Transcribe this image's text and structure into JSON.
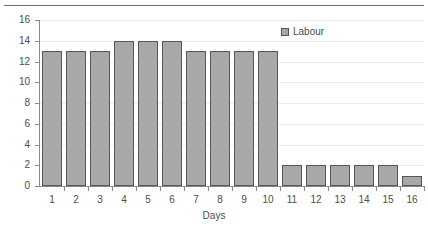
{
  "chart_data": {
    "type": "bar",
    "title": "",
    "xlabel": "Days",
    "ylabel": "",
    "categories": [
      "1",
      "2",
      "3",
      "4",
      "5",
      "6",
      "7",
      "8",
      "9",
      "10",
      "11",
      "12",
      "13",
      "14",
      "15",
      "16"
    ],
    "values": [
      13,
      13,
      13,
      14,
      14,
      14,
      13,
      13,
      13,
      13,
      2,
      2,
      2,
      2,
      2,
      1
    ],
    "series": [
      {
        "name": "Labour",
        "values": [
          13,
          13,
          13,
          14,
          14,
          14,
          13,
          13,
          13,
          13,
          2,
          2,
          2,
          2,
          2,
          1
        ]
      }
    ],
    "ylim": [
      0,
      16
    ],
    "ytick_step": 2,
    "yticks": [
      "0",
      "2",
      "4",
      "6",
      "8",
      "10",
      "12",
      "14",
      "16"
    ],
    "grid": true,
    "grid_axis": "y",
    "legend": [
      "Labour"
    ],
    "legend_position": "top-right",
    "bar_color": "#a8a8a8",
    "bar_border_color": "#575757",
    "grid_color": "#ededed",
    "axis_color": "#8a8a8a",
    "text_color": "#4d4d4d"
  },
  "axis": {
    "x_title": "Days"
  },
  "legend": {
    "entries": [
      {
        "label": "Labour",
        "color": "#a8a8a8"
      }
    ]
  }
}
